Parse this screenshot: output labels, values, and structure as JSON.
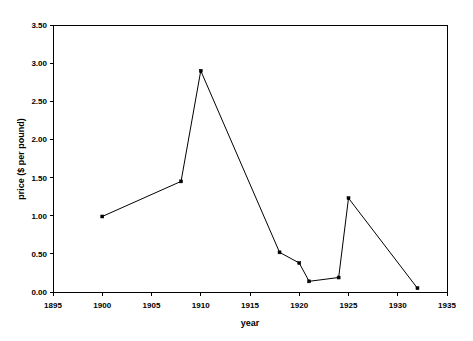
{
  "figure": {
    "top_cut_text": "",
    "background_color": "#ffffff",
    "line_color": "#000000"
  },
  "axes": {
    "x_title": "year",
    "y_title": "price ($ per pound)",
    "x_ticks": [
      "1895",
      "1900",
      "1905",
      "1910",
      "1915",
      "1920",
      "1925",
      "1930",
      "1935"
    ],
    "y_ticks": [
      "0.00",
      "0.50",
      "1.00",
      "1.50",
      "2.00",
      "2.50",
      "3.00",
      "3.50"
    ]
  },
  "chart_data": {
    "type": "line",
    "title": "",
    "xlabel": "year",
    "ylabel": "price ($ per pound)",
    "xlim": [
      1895,
      1935
    ],
    "ylim": [
      0.0,
      3.5
    ],
    "xticks": [
      1895,
      1900,
      1905,
      1910,
      1915,
      1920,
      1925,
      1930,
      1935
    ],
    "yticks": [
      0.0,
      0.5,
      1.0,
      1.5,
      2.0,
      2.5,
      3.0,
      3.5
    ],
    "grid": false,
    "legend": false,
    "marker": "square",
    "x": [
      1900,
      1908,
      1910,
      1918,
      1920,
      1921,
      1924,
      1925,
      1932
    ],
    "values": [
      0.99,
      1.45,
      2.9,
      0.52,
      0.38,
      0.14,
      0.19,
      1.23,
      0.05
    ],
    "series": [
      {
        "name": "price",
        "color": "#000000",
        "points": [
          {
            "year": 1900,
            "price": 0.99
          },
          {
            "year": 1908,
            "price": 1.45
          },
          {
            "year": 1910,
            "price": 2.9
          },
          {
            "year": 1918,
            "price": 0.52
          },
          {
            "year": 1920,
            "price": 0.38
          },
          {
            "year": 1921,
            "price": 0.14
          },
          {
            "year": 1924,
            "price": 0.19
          },
          {
            "year": 1925,
            "price": 1.23
          },
          {
            "year": 1932,
            "price": 0.05
          }
        ]
      }
    ]
  }
}
